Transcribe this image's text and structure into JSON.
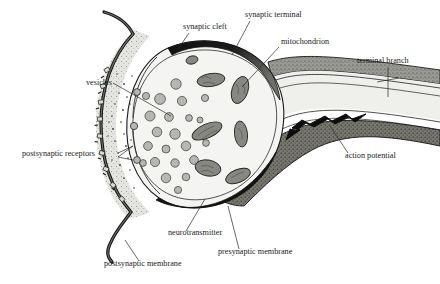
{
  "figure": {
    "kind": "diagram",
    "background_color": "#ffffff"
  },
  "palette": {
    "ink": "#1b1b1b",
    "leader_line": "#2a2a2a",
    "terminal_fill": "#f2f2f0",
    "cleft_fill": "#e2e2de",
    "axon_fill": "#e8e8e5",
    "membrane_dark": "#111111",
    "axon_wall_gray": "#8e8e8a",
    "vesicle_fill": "#b9b9b4",
    "mitochondrion_fill": "#8a8a85",
    "stipple": "#4a4a46"
  },
  "labels": {
    "synaptic_cleft": "synaptic cleft",
    "synaptic_terminal": "synaptic terminal",
    "mitochondrion": "mitochondrion",
    "terminal_branch": "terminal branch",
    "vesicles": "vesicles",
    "postsynaptic_receptors": "postsynaptic receptors",
    "action_potential": "action potential",
    "neurotransmitter": "neurotransmitter",
    "presynaptic_membrane": "presynaptic membrane",
    "postsynaptic_membrane": "postsynaptic membrane"
  },
  "label_positions": {
    "synaptic_cleft": {
      "x": 183,
      "y": 29,
      "anchor": "start"
    },
    "synaptic_terminal": {
      "x": 245,
      "y": 17,
      "anchor": "start"
    },
    "mitochondrion": {
      "x": 281,
      "y": 44,
      "anchor": "start"
    },
    "terminal_branch": {
      "x": 357,
      "y": 63,
      "anchor": "start"
    },
    "vesicles": {
      "x": 86,
      "y": 85,
      "anchor": "start"
    },
    "postsynaptic_receptors": {
      "x": 22,
      "y": 156,
      "anchor": "start"
    },
    "action_potential": {
      "x": 345,
      "y": 158,
      "anchor": "start"
    },
    "neurotransmitter": {
      "x": 168,
      "y": 235,
      "anchor": "start"
    },
    "presynaptic_membrane": {
      "x": 218,
      "y": 254,
      "anchor": "start"
    },
    "postsynaptic_membrane": {
      "x": 104,
      "y": 266,
      "anchor": "start"
    }
  },
  "structures": {
    "vesicle_count": 22,
    "mitochondrion_count": 7,
    "receptor_count": 9,
    "action_potential_direction": "leftward"
  }
}
